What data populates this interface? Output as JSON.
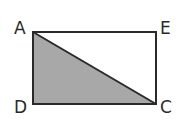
{
  "diagram": {
    "type": "geometry",
    "colors": {
      "stroke": "#2a2a2a",
      "shade": "#a8a8a8",
      "background": "#ffffff"
    },
    "points": {
      "A": {
        "label": "A",
        "x": 33,
        "y": 32
      },
      "E": {
        "label": "E",
        "x": 156,
        "y": 32
      },
      "C": {
        "label": "C",
        "x": 156,
        "y": 104
      },
      "D": {
        "label": "D",
        "x": 33,
        "y": 104
      }
    },
    "segments": [
      [
        "A",
        "E"
      ],
      [
        "E",
        "C"
      ],
      [
        "C",
        "D"
      ],
      [
        "D",
        "A"
      ],
      [
        "A",
        "C"
      ]
    ],
    "shaded_region": [
      "A",
      "D",
      "C"
    ]
  }
}
